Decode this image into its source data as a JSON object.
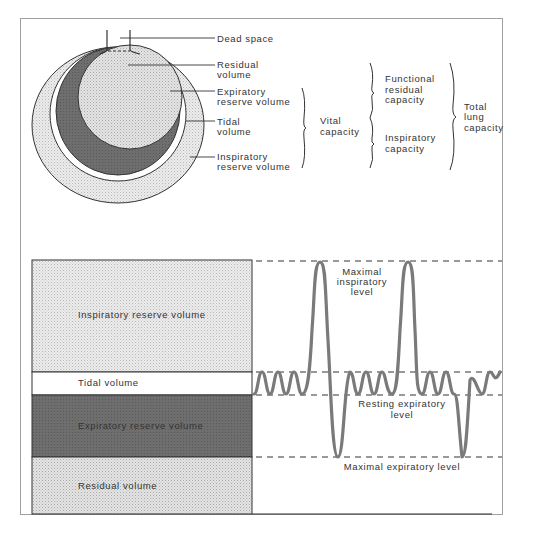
{
  "diagram": {
    "type": "lung-volumes-and-capacities",
    "colors": {
      "frame": "#9a9a9a",
      "light_fill": "#e6e6e6",
      "dark_fill": "#6a6a6a",
      "white_fill": "#ffffff",
      "waveform": "#7a7a7a",
      "text": "#333333"
    },
    "circle_labels": {
      "dead_space": "Dead space",
      "residual_volume": [
        "Residual",
        "volume"
      ],
      "expiratory_reserve_volume": [
        "Expiratory",
        "reserve volume"
      ],
      "tidal_volume": [
        "Tidal",
        "volume"
      ],
      "inspiratory_reserve_volume": [
        "Inspiratory",
        "reserve volume"
      ]
    },
    "capacities": {
      "vital_capacity": [
        "Vital",
        "capacity"
      ],
      "functional_residual_capacity": [
        "Functional",
        "residual",
        "capacity"
      ],
      "inspiratory_capacity": [
        "Inspiratory",
        "capacity"
      ],
      "total_lung_capacity": [
        "Total",
        "lung",
        "capacity"
      ]
    },
    "bar_labels": {
      "inspiratory_reserve_volume": "Inspiratory reserve volume",
      "tidal_volume": "Tidal volume",
      "expiratory_reserve_volume": "Expiratory reserve volume",
      "residual_volume": "Residual volume"
    },
    "levels": {
      "maximal_inspiratory": [
        "Maximal",
        "inspiratory",
        "level"
      ],
      "resting_expiratory": [
        "Resting expiratory",
        "level"
      ],
      "maximal_expiratory": "Maximal expiratory level"
    }
  }
}
